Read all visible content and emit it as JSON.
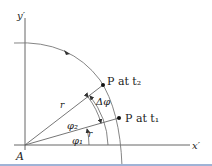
{
  "diagram": {
    "axes": {
      "x_label": "x′",
      "y_label": "y′",
      "origin_label": "A"
    },
    "points": [
      {
        "label": "P at t₂",
        "name": "P",
        "time": "t₂"
      },
      {
        "label": "P at t₁",
        "name": "P",
        "time": "t₁"
      }
    ],
    "radius_labels": [
      "r",
      "r"
    ],
    "angles": {
      "phi1": "φ₁",
      "phi2": "φ₂",
      "delta_phi": "Δφ"
    },
    "colors": {
      "line": "#555555",
      "text": "#222222",
      "background": "#ffffff",
      "strip": "#9fb3d6"
    }
  }
}
